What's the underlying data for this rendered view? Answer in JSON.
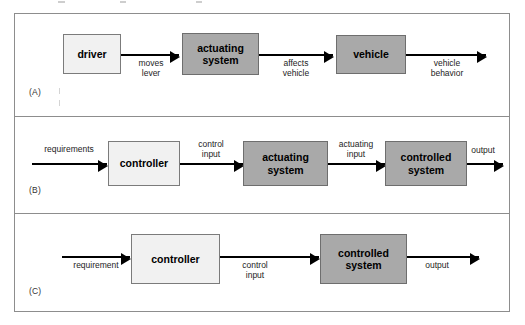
{
  "figure": {
    "type": "block-diagram",
    "background_color": "#ffffff",
    "panel_border_color": "#8d8d8d"
  },
  "colors": {
    "box_light_fill": "#f1f1f1",
    "box_dark_fill": "#a9a9a9",
    "box_border": "#7b7b7b",
    "arrow": "#000000",
    "label_text": "#1d1d1d"
  },
  "panels": [
    {
      "tag": "(A)",
      "blocks": [
        {
          "label": "driver",
          "shade": "light"
        },
        {
          "label": "actuating system",
          "line1": "actuating",
          "line2": "system",
          "shade": "dark"
        },
        {
          "label": "vehicle",
          "shade": "dark"
        }
      ],
      "edges": [
        {
          "label": "moves lever",
          "line1": "moves",
          "line2": "lever",
          "position": "below"
        },
        {
          "label": "affects vehicle",
          "line1": "affects",
          "line2": "vehicle",
          "position": "below"
        },
        {
          "label": "vehicle behavior",
          "line1": "vehicle",
          "line2": "behavior",
          "position": "below"
        }
      ]
    },
    {
      "tag": "(B)",
      "blocks": [
        {
          "label": "controller",
          "shade": "light"
        },
        {
          "label": "actuating system",
          "line1": "actuating",
          "line2": "system",
          "shade": "dark"
        },
        {
          "label": "controlled system",
          "line1": "controlled",
          "line2": "system",
          "shade": "dark"
        }
      ],
      "edges": [
        {
          "label": "requirements",
          "line1": "requirements",
          "line2": "",
          "position": "above"
        },
        {
          "label": "control input",
          "line1": "control",
          "line2": "input",
          "position": "above"
        },
        {
          "label": "actuating input",
          "line1": "actuating",
          "line2": "input",
          "position": "above"
        },
        {
          "label": "output",
          "line1": "output",
          "line2": "",
          "position": "above"
        }
      ]
    },
    {
      "tag": "(C)",
      "blocks": [
        {
          "label": "controller",
          "shade": "light"
        },
        {
          "label": "controlled system",
          "line1": "controlled",
          "line2": "system",
          "shade": "dark"
        }
      ],
      "edges": [
        {
          "label": "requirement",
          "line1": "requirement",
          "line2": "",
          "position": "below"
        },
        {
          "label": "control input",
          "line1": "control",
          "line2": "input",
          "position": "below"
        },
        {
          "label": "output",
          "line1": "output",
          "line2": "",
          "position": "below"
        }
      ]
    }
  ]
}
